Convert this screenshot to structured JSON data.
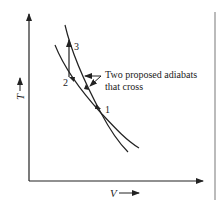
{
  "diagram": {
    "title": "",
    "axes": {
      "x_label": "V",
      "y_label": "T"
    },
    "points": [
      {
        "id": "1",
        "label": "1"
      },
      {
        "id": "2",
        "label": "2"
      },
      {
        "id": "3",
        "label": "3"
      }
    ],
    "annotation": {
      "line1": "Two proposed adiabats",
      "line2": "that cross"
    },
    "colors": {
      "ink": "#222222",
      "background": "#ffffff"
    }
  }
}
